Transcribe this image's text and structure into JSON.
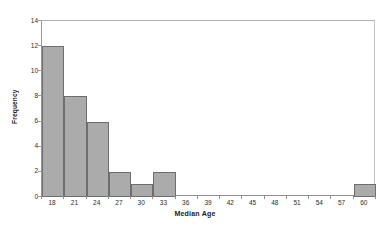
{
  "chart_data": {
    "type": "bar",
    "title": "",
    "xlabel": "Median Age",
    "ylabel": "Frequency",
    "categories": [
      "18",
      "21",
      "24",
      "27",
      "30",
      "33",
      "36",
      "39",
      "42",
      "45",
      "48",
      "51",
      "54",
      "57",
      "60"
    ],
    "values": [
      12,
      8,
      6,
      2,
      1,
      2,
      0,
      0,
      0,
      0,
      0,
      0,
      0,
      0,
      1
    ],
    "bin_width": 3,
    "xlim": [
      16.5,
      61.5
    ],
    "ylim": [
      0,
      14
    ],
    "y_ticks": [
      0,
      2,
      4,
      6,
      8,
      10,
      12,
      14
    ],
    "x_ticks": [
      "18",
      "21",
      "24",
      "27",
      "30",
      "33",
      "36",
      "39",
      "42",
      "45",
      "48",
      "51",
      "54",
      "57",
      "60"
    ],
    "grid": false,
    "legend": false,
    "bar_fill_color": "#ababab",
    "bar_border_color": "#6e6e6e",
    "plot_border_color": "#b9b9b9",
    "background_color": "#ffffff"
  }
}
